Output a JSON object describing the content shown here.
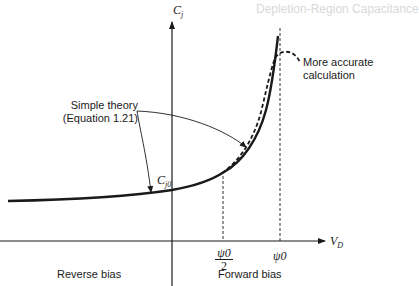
{
  "diagram": {
    "type": "junction-capacitance-vs-voltage",
    "y_axis_label": "C",
    "y_axis_subscript": "j",
    "x_axis_label": "V",
    "x_axis_subscript": "D",
    "c_j0_label": "C",
    "c_j0_subscript": "j0",
    "tick_half_psi_num": "ψ0",
    "tick_half_psi_den": "2",
    "tick_psi": "ψ0",
    "annotations": {
      "simple_theory_line1": "Simple theory",
      "simple_theory_line2": "(Equation 1.21)",
      "accurate_line1": "More accurate",
      "accurate_line2": "calculation"
    },
    "regions": {
      "reverse": "Reverse bias",
      "forward": "Forward bias"
    }
  },
  "background_text": {
    "heading": "Depletion-Region Capacitance"
  },
  "colors": {
    "ink": "#1a1a1a",
    "faint": "#d9d9d9",
    "background": "#ffffff"
  }
}
